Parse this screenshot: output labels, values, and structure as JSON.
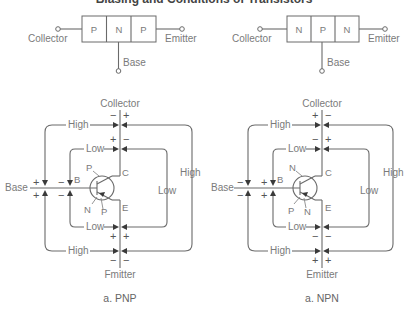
{
  "title": "Biasing and Conditions of Transistors",
  "schematics": {
    "pnp": {
      "regions": [
        "P",
        "N",
        "P"
      ],
      "left_terminal": "Collector",
      "right_terminal": "Emitter",
      "bottom_terminal": "Base"
    },
    "npn": {
      "regions": [
        "N",
        "P",
        "N"
      ],
      "left_terminal": "Collector",
      "right_terminal": "Emitter",
      "bottom_terminal": "Base"
    }
  },
  "circuits": {
    "pnp": {
      "caption": "a. PNP",
      "collector_label": "Collector",
      "emitter_label": "Emitter_typo",
      "emitter_label_display": "Fmitter",
      "base_label": "Base",
      "pin_b": "B",
      "pin_c": "C",
      "pin_e": "E",
      "junction_labels": {
        "collector_side": "P",
        "base_side": "N",
        "emitter_side": "P"
      },
      "loops": {
        "high": "High",
        "low": "Low"
      },
      "signs": {
        "collector_high": [
          "−",
          "+"
        ],
        "collector_low": [
          "+",
          "−"
        ],
        "base_high_top": "+",
        "base_high_bottom": "+",
        "base_low_top": "−",
        "base_low_bottom": "−",
        "emitter_low": [
          "+",
          "+"
        ],
        "emitter_high": [
          "−",
          "−"
        ]
      }
    },
    "npn": {
      "caption": "a. NPN",
      "collector_label": "Collector",
      "emitter_label_display": "Emitter",
      "base_label": "Base",
      "pin_b": "B",
      "pin_c": "C",
      "pin_e": "E",
      "junction_labels": {
        "collector_side": "N",
        "base_side": "P",
        "emitter_side": "N"
      },
      "loops": {
        "high": "High",
        "low": "Low"
      },
      "signs": {
        "collector_high": [
          "+",
          "−"
        ],
        "collector_low": [
          "−",
          "+"
        ],
        "base_high_top": "−",
        "base_high_bottom": "−",
        "base_low_top": "+",
        "base_low_bottom": "+",
        "emitter_low": [
          "−",
          "−"
        ],
        "emitter_high": [
          "+",
          "+"
        ]
      }
    }
  },
  "colors": {
    "line": "#6a6a6a",
    "text": "#7a7a7a",
    "arrow": "#3a3a3a"
  }
}
